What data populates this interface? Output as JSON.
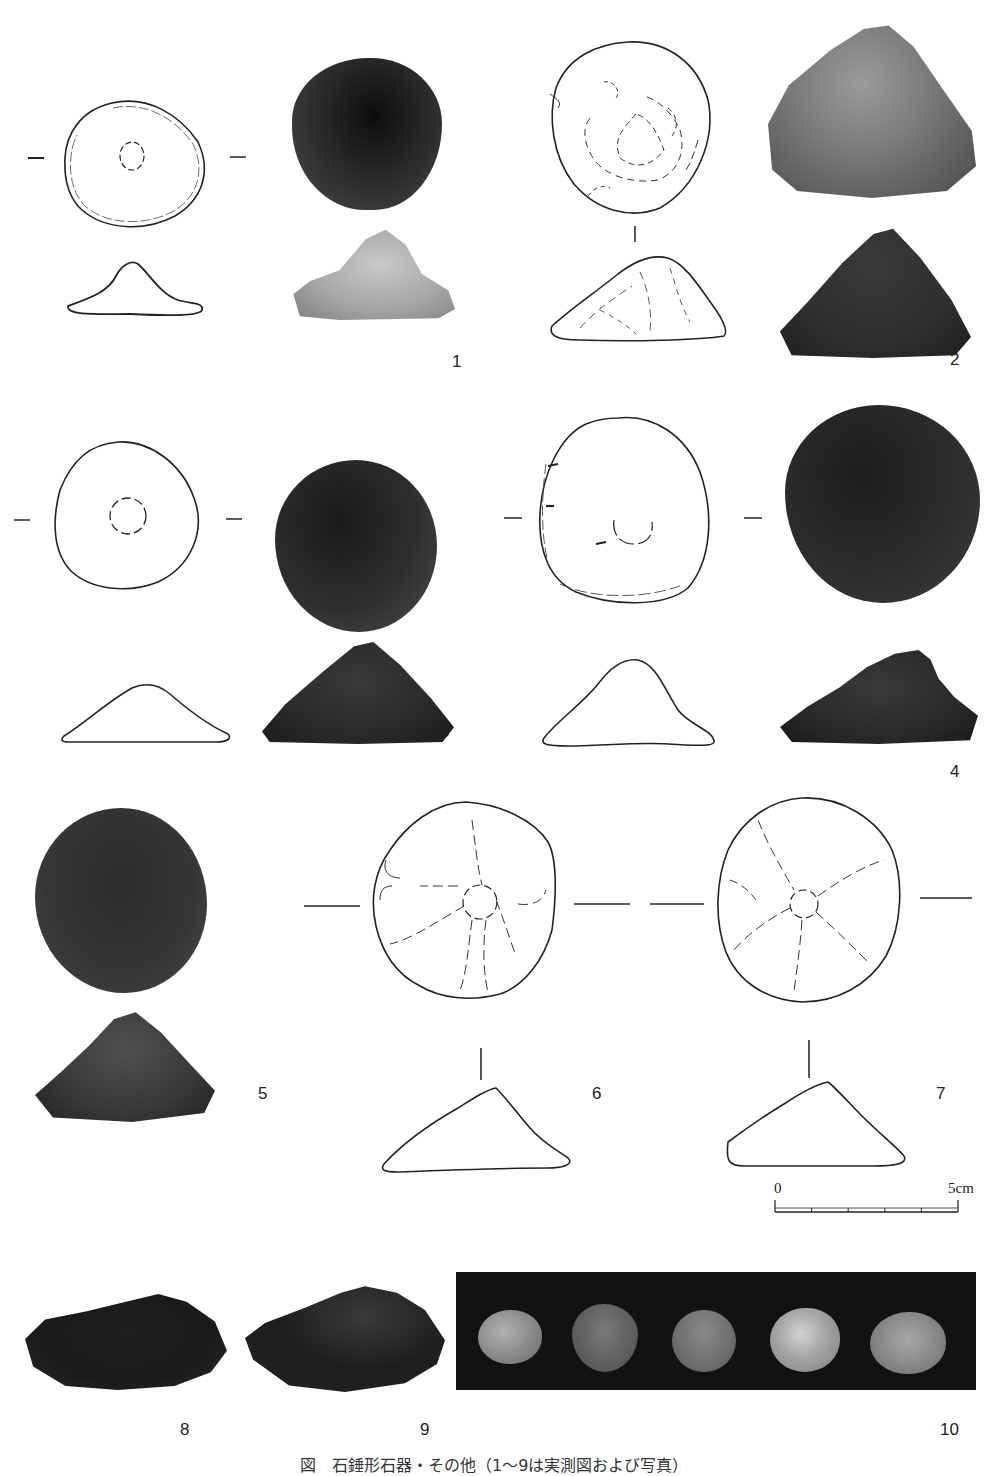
{
  "plate": {
    "figures": [
      {
        "id": "1",
        "label": "1",
        "views": [
          "drawing-plan",
          "drawing-profile",
          "photo-plan",
          "photo-profile"
        ]
      },
      {
        "id": "2",
        "label": "2",
        "views": [
          "drawing-plan",
          "drawing-profile",
          "photo-oblique",
          "photo-profile"
        ]
      },
      {
        "id": "3",
        "label": "3",
        "views": [
          "drawing-plan",
          "drawing-profile",
          "photo-plan",
          "photo-profile"
        ]
      },
      {
        "id": "4",
        "label": "4",
        "views": [
          "drawing-plan",
          "drawing-profile",
          "photo-plan",
          "photo-profile"
        ]
      },
      {
        "id": "5",
        "label": "5",
        "views": [
          "photo-plan",
          "photo-profile"
        ]
      },
      {
        "id": "6",
        "label": "6",
        "views": [
          "drawing-plan",
          "drawing-profile"
        ]
      },
      {
        "id": "7",
        "label": "7",
        "views": [
          "drawing-plan",
          "drawing-profile"
        ]
      },
      {
        "id": "8",
        "label": "8",
        "views": [
          "photo-profile"
        ]
      },
      {
        "id": "9",
        "label": "9",
        "views": [
          "photo-profile"
        ]
      },
      {
        "id": "10",
        "label": "10",
        "views": [
          "photo-group-of-5"
        ]
      }
    ],
    "scale_bar": {
      "start_label": "0",
      "end_label": "5cm",
      "divisions": 5
    },
    "caption": "図　石錘形石器・その他（1〜9は実測図および写真）",
    "colors": {
      "ink": "#222222",
      "photo_dark": "#2a2a2a",
      "photo_mid": "#6a6a6a",
      "photo_light": "#a8a8a8",
      "background_panel": "#111111"
    }
  }
}
